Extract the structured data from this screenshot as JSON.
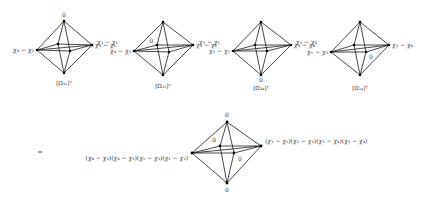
{
  "diagram": {
    "top_row": [
      {
        "id": "omega_12",
        "caption": "[Ω₁₂]ᵀ",
        "center_x": 64,
        "labels": {
          "top": "0",
          "left": "χ₄ − χ₃",
          "right": "χ₃ − χ₁",
          "bottom": "",
          "back": "",
          "front": ""
        }
      },
      {
        "id": "omega_13",
        "caption": "[Ω₁₃]ᵀ",
        "center_x": 163,
        "labels": {
          "top": "",
          "left": "χ₄ − χ₃",
          "right": "χ₃ − χ₁",
          "bottom": "",
          "back": "0",
          "front": ""
        }
      },
      {
        "id": "omega_34",
        "caption": "[Ω₃₄]ᵀ",
        "center_x": 260,
        "labels": {
          "top": "",
          "left": "χ₁ − χ₃",
          "right": "χ₃ − χ₄",
          "bottom": "0",
          "back": "",
          "front": ""
        }
      },
      {
        "id": "omega_24",
        "caption": "[Ω₂₄]ᵀ",
        "center_x": 359,
        "labels": {
          "top": "",
          "left": "χ₁ − χ₃",
          "right": "χ₃ − χ₄",
          "bottom": "",
          "back": "",
          "front": "0"
        }
      }
    ],
    "top_row_left_outer_labels": [
      "χ₃ − χ₁",
      "χ₃ − χ₁",
      "χ₃ − χ₄"
    ],
    "equals_sign": "=",
    "result": {
      "left_label": "(χ₄ − χ₃)(χ₄ − χ₃)(χ₁ − χ₃)(χ₁ − χ₃)",
      "right_label": "(χ₃ − χ₁)(χ₃ − χ₁)(χ₃ − χ₄)(χ₃ − χ₄)",
      "top_label": "0",
      "bottom_label": "0",
      "back_label": "0",
      "front_label": "0"
    }
  }
}
